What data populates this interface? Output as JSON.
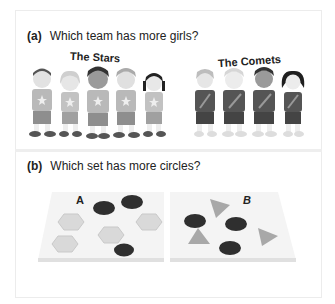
{
  "part_a": {
    "label": "(a)",
    "question": "Which team has more girls?",
    "teams": [
      {
        "name": "The Stars",
        "members": 5,
        "shirt_emblem": "star"
      },
      {
        "name": "The Comets",
        "members": 4,
        "shirt_emblem": "comet"
      }
    ]
  },
  "part_b": {
    "label": "(b)",
    "question": "Which set has more circles?",
    "sets": [
      {
        "name": "A",
        "circles": 3,
        "hexagons": 5
      },
      {
        "name": "B",
        "circles": 4,
        "triangles": 4
      }
    ]
  },
  "colors": {
    "stars_shirt": "#b9b9b9",
    "comets_shirt": "#555555",
    "circle": "#2f2f2f",
    "hexagon": "#d9d9d9",
    "triangle": "#a8a8a8"
  }
}
